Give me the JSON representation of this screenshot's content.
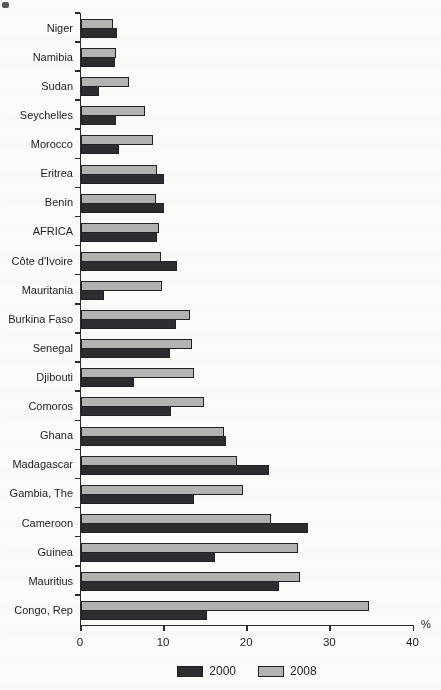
{
  "chart_data": {
    "type": "bar",
    "orientation": "horizontal",
    "title": "",
    "xlabel": "%",
    "xlim": [
      0,
      40
    ],
    "xticks": [
      0,
      10,
      20,
      30,
      40
    ],
    "grid": false,
    "legend_position": "bottom",
    "row_series_order_top_to_bottom": [
      "2008",
      "2000"
    ],
    "categories": [
      "Niger",
      "Namibia",
      "Sudan",
      "Seychelles",
      "Morocco",
      "Eritrea",
      "Benin",
      "AFRICA",
      "Côte d'Ivoire",
      "Mauritania",
      "Burkina Faso",
      "Senegal",
      "Djibouti",
      "Comoros",
      "Ghana",
      "Madagascar",
      "Gambia, The",
      "Cameroon",
      "Guinea",
      "Mauritius",
      "Congo, Rep"
    ],
    "series": [
      {
        "name": "2000",
        "color": "#2d2d31",
        "values": [
          4.3,
          4.1,
          2.2,
          4.2,
          4.6,
          10.0,
          10.0,
          9.1,
          11.6,
          2.8,
          11.4,
          10.7,
          6.4,
          10.8,
          17.5,
          22.6,
          13.6,
          27.3,
          16.1,
          23.8,
          15.2
        ]
      },
      {
        "name": "2008",
        "color": "#b3b3b1",
        "values": [
          3.8,
          4.2,
          5.8,
          7.7,
          8.7,
          9.1,
          9.0,
          9.4,
          9.6,
          9.7,
          13.1,
          13.3,
          13.6,
          14.8,
          17.2,
          18.8,
          19.5,
          22.8,
          26.1,
          26.4,
          34.7
        ]
      }
    ],
    "colors": {
      "axis": "#2b2b2b",
      "text": "#1d1d1d",
      "bar_border": "#222226",
      "paper": "#fbfbf9"
    }
  }
}
